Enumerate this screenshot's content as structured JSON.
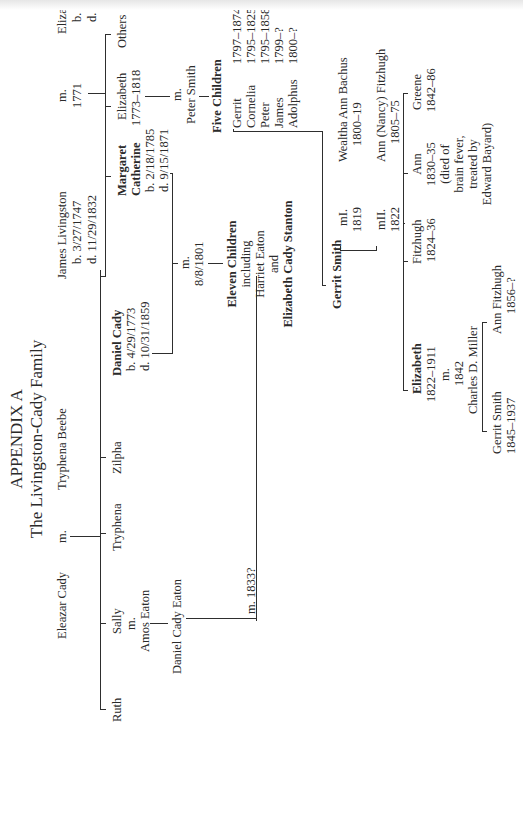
{
  "title": {
    "heading": "APPENDIX A",
    "subtitle": "The Livingston-Cady Family"
  },
  "generation1": {
    "eleazar": "Eleazar Cady",
    "eleazar_m": "m.",
    "tryphena_beebe": "Tryphena Beebe",
    "james": "James Livingston",
    "james_b": "b. 3/27/1747",
    "james_d": "d. 11/29/1832",
    "james_m": "m.",
    "james_m_year": "1771",
    "elizabeth_simpson": "Elizabeth Simpson",
    "elizabeth_simpson_b": "b. 10/10/1750",
    "elizabeth_simpson_d": "d. 6/10/1800"
  },
  "cady_children": {
    "ruth": "Ruth",
    "sally": "Sally",
    "sally_m": "m.",
    "amos_eaton": "Amos Eaton",
    "tryphena": "Tryphena",
    "zilpha": "Zilpha",
    "daniel": "Daniel Cady",
    "daniel_b": "b. 4/29/1773",
    "daniel_d": "d. 10/31/1859"
  },
  "livingston_children": {
    "margaret_1": "Margaret",
    "margaret_2": "Catherine",
    "margaret_b": "b. 2/18/1785",
    "margaret_d": "d. 9/15/1871",
    "elizabeth": "Elizabeth",
    "elizabeth_years": "1773–1818",
    "others": "Others",
    "peter_m": "m.",
    "peter_smith": "Peter Smith"
  },
  "cady_marriage": {
    "m": "m.",
    "date": "8/8/1801",
    "children_1": "Eleven Children",
    "children_2": "including",
    "children_3": "Harriet Eaton",
    "children_4": "and",
    "children_5": "Elizabeth Cady Stanton"
  },
  "eaton": {
    "daniel_cady_eaton": "Daniel Cady Eaton",
    "marriage": "m. 1833?"
  },
  "five_children": {
    "heading": "Five Children",
    "list": [
      {
        "name": "Gerrit",
        "years": "1797–1874"
      },
      {
        "name": "Cornelia",
        "years": "1795–1825"
      },
      {
        "name": "Peter",
        "years": "1795–1858"
      },
      {
        "name": "James",
        "years": "1799–?"
      },
      {
        "name": "Adolphus",
        "years": "1800–?"
      }
    ]
  },
  "gerrit": {
    "name": "Gerrit Smith",
    "m1": "mI.",
    "m1_year": "1819",
    "spouse1": "Wealtha Ann Bachus",
    "spouse1_years": "1800–19",
    "m2": "mII.",
    "m2_year": "1822",
    "spouse2": "Ann (Nancy) Fitzhugh",
    "spouse2_years": "1805–75"
  },
  "gerrit_children": {
    "elizabeth": "Elizabeth",
    "elizabeth_years": "1822–1911",
    "elizabeth_m": "m.",
    "elizabeth_m_year": "1842",
    "elizabeth_spouse": "Charles D. Miller",
    "fitzhugh": "Fitzhugh",
    "fitzhugh_years": "1824–36",
    "ann": "Ann",
    "ann_years": "1830–35",
    "ann_note_1": "(died of",
    "ann_note_2": "brain fever,",
    "ann_note_3": "treated by",
    "ann_note_4": "Edward Bayard)",
    "greene": "Greene",
    "greene_years": "1842–86"
  },
  "miller_children": {
    "gerrit": "Gerrit Smith",
    "gerrit_years": "1845–1937",
    "ann": "Ann Fitzhugh",
    "ann_years": "1856–?"
  }
}
